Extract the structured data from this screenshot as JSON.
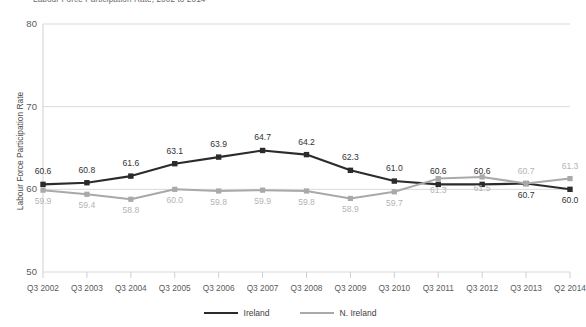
{
  "chart_data": {
    "type": "line",
    "title": "Labour Force Participation Rate, 2002 to 2014",
    "xlabel": "",
    "ylabel": "Labour Force Participation Rate",
    "ylim": [
      50,
      80
    ],
    "yticks": [
      "50",
      "60",
      "70",
      "80"
    ],
    "grid": true,
    "legend_position": "bottom",
    "categories": [
      "Q3 2002",
      "Q3 2003",
      "Q3 2004",
      "Q3 2005",
      "Q3 2006",
      "Q3 2007",
      "Q3 2008",
      "Q3 2009",
      "Q3 2010",
      "Q3 2011",
      "Q3 2012",
      "Q3 2013",
      "Q2 2014"
    ],
    "series": [
      {
        "name": "Ireland",
        "color": "#2b2b2b",
        "values": [
          60.6,
          60.8,
          61.6,
          63.1,
          63.9,
          64.7,
          64.2,
          62.3,
          61.0,
          60.6,
          60.6,
          60.7,
          60.0
        ],
        "labels": [
          "60.6",
          "60.8",
          "61.6",
          "63.1",
          "63.9",
          "64.7",
          "64.2",
          "62.3",
          "61.0",
          "60.6",
          "60.6",
          "60.7",
          "60.0"
        ],
        "label_side": [
          "above",
          "above",
          "above",
          "above",
          "above",
          "above",
          "above",
          "above",
          "above",
          "above",
          "above",
          "below",
          "below"
        ]
      },
      {
        "name": "N. Ireland",
        "color": "#a9a9a9",
        "values": [
          59.9,
          59.4,
          58.8,
          60.0,
          59.8,
          59.9,
          59.8,
          58.9,
          59.7,
          61.3,
          61.5,
          60.7,
          61.3
        ],
        "labels": [
          "59.9",
          "59.4",
          "58.8",
          "60.0",
          "59.8",
          "59.9",
          "59.8",
          "58.9",
          "59.7",
          "61.3",
          "61.5",
          "60.7",
          "61.3"
        ],
        "label_side": [
          "below",
          "below",
          "below",
          "below",
          "below",
          "below",
          "below",
          "below",
          "below",
          "below",
          "below",
          "above",
          "above"
        ]
      }
    ]
  },
  "legend": {
    "items": [
      {
        "label": "Ireland",
        "color": "#2b2b2b"
      },
      {
        "label": "N. Ireland",
        "color": "#a9a9a9"
      }
    ]
  }
}
